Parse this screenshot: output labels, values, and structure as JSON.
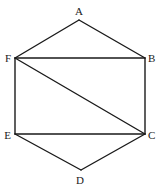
{
  "diagram": {
    "title": "",
    "vertices": [
      {
        "id": "A",
        "label": "A",
        "x": 79,
        "y": 20,
        "lx": 79,
        "ly": 15,
        "anchor": "middle"
      },
      {
        "id": "B",
        "label": "B",
        "x": 145,
        "y": 58,
        "lx": 148,
        "ly": 62,
        "anchor": "start"
      },
      {
        "id": "C",
        "label": "C",
        "x": 145,
        "y": 134,
        "lx": 148,
        "ly": 139,
        "anchor": "start"
      },
      {
        "id": "D",
        "label": "D",
        "x": 81,
        "y": 170,
        "lx": 80,
        "ly": 184,
        "anchor": "middle"
      },
      {
        "id": "E",
        "label": "E",
        "x": 15,
        "y": 134,
        "lx": 11,
        "ly": 139,
        "anchor": "end"
      },
      {
        "id": "F",
        "label": "F",
        "x": 15,
        "y": 58,
        "lx": 11,
        "ly": 62,
        "anchor": "end"
      }
    ],
    "edges": [
      {
        "from": "A",
        "to": "B"
      },
      {
        "from": "B",
        "to": "C"
      },
      {
        "from": "C",
        "to": "D"
      },
      {
        "from": "D",
        "to": "E"
      },
      {
        "from": "E",
        "to": "F"
      },
      {
        "from": "F",
        "to": "A"
      },
      {
        "from": "F",
        "to": "B"
      },
      {
        "from": "F",
        "to": "C"
      },
      {
        "from": "E",
        "to": "C"
      }
    ],
    "colors": {
      "stroke": "#1a1a1a",
      "background": "#ffffff"
    }
  }
}
